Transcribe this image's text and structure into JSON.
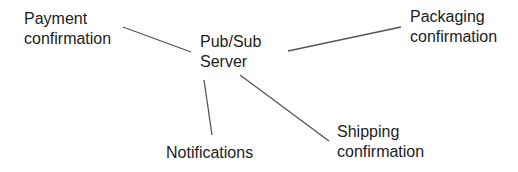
{
  "diagram": {
    "hub": {
      "id": "pubsub",
      "lines": [
        "Pub/Sub",
        "Server"
      ],
      "pos": {
        "x": 200,
        "y": 32
      }
    },
    "nodes": [
      {
        "id": "payment",
        "lines": [
          "Payment",
          "confirmation"
        ],
        "pos": {
          "x": 24,
          "y": 9
        }
      },
      {
        "id": "packaging",
        "lines": [
          "Packaging",
          "confirmation"
        ],
        "pos": {
          "x": 410,
          "y": 7
        }
      },
      {
        "id": "notifications",
        "lines": [
          "Notifications"
        ],
        "pos": {
          "x": 166,
          "y": 143
        }
      },
      {
        "id": "shipping",
        "lines": [
          "Shipping",
          "confirmation"
        ],
        "pos": {
          "x": 337,
          "y": 122
        }
      }
    ],
    "edges": [
      {
        "from": "payment",
        "to": "pubsub",
        "x1": 123,
        "y1": 27,
        "x2": 191,
        "y2": 52
      },
      {
        "from": "pubsub",
        "to": "packaging",
        "x1": 288,
        "y1": 51,
        "x2": 401,
        "y2": 27
      },
      {
        "from": "pubsub",
        "to": "notifications",
        "x1": 204,
        "y1": 80,
        "x2": 212,
        "y2": 135
      },
      {
        "from": "pubsub",
        "to": "shipping",
        "x1": 240,
        "y1": 75,
        "x2": 329,
        "y2": 141
      }
    ],
    "colors": {
      "text": "#222222",
      "line": "#555555",
      "background": "#ffffff"
    }
  }
}
